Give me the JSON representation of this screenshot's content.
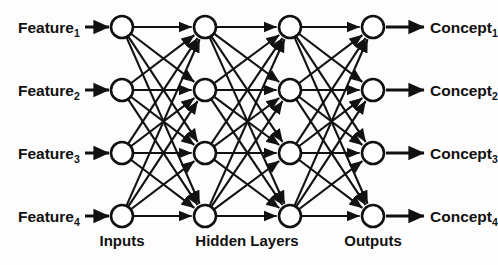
{
  "diagram": {
    "background_color": "#fdfdfd",
    "stroke_color": "#111111",
    "node_fill_color": "#ffffff",
    "geometry": {
      "width": 498,
      "height": 265,
      "node_radius": 11,
      "column_x": [
        122,
        205,
        290,
        373
      ],
      "row_y": [
        27,
        90,
        153,
        216
      ],
      "input_arrow_x_start": 85,
      "input_arrow_x_end": 109,
      "output_arrow_x_start": 386,
      "output_arrow_x_end": 424,
      "caption_y": 246,
      "input_label_x": 18,
      "output_label_x": 430
    },
    "input_labels": [
      {
        "text": "Feature",
        "sub": "1"
      },
      {
        "text": "Feature",
        "sub": "2"
      },
      {
        "text": "Feature",
        "sub": "3"
      },
      {
        "text": "Feature",
        "sub": "4"
      }
    ],
    "output_labels": [
      {
        "text": "Concept",
        "sub": "1"
      },
      {
        "text": "Concept",
        "sub": "2"
      },
      {
        "text": "Concept",
        "sub": "3"
      },
      {
        "text": "Concept",
        "sub": "4"
      }
    ],
    "layers": [
      {
        "id": "inputs",
        "caption": "Inputs",
        "caption_x": 122,
        "node_count": 4
      },
      {
        "id": "hidden-1",
        "caption": "",
        "caption_x": 205,
        "node_count": 4
      },
      {
        "id": "hidden-2",
        "caption": "Hidden Layers",
        "caption_x": 247,
        "node_count": 4
      },
      {
        "id": "outputs",
        "caption": "Outputs",
        "caption_x": 373,
        "node_count": 4
      }
    ],
    "captions": [
      {
        "text": "Inputs",
        "x": 122
      },
      {
        "text": "Hidden Layers",
        "x": 247
      },
      {
        "text": "Outputs",
        "x": 373
      }
    ],
    "connectivity": "fully-connected",
    "edges_per_gap": 16,
    "total_edges": 48
  }
}
